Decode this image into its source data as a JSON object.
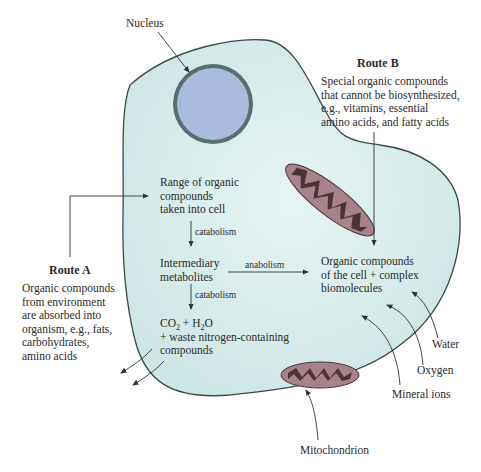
{
  "diagram": {
    "colors": {
      "cell_fill": "#dcefee",
      "cell_stroke": "#3b4a4a",
      "nucleus_fill": "#aabbdd",
      "nucleus_ring": "#55706e",
      "mito_outer": "#a8828a",
      "mito_inner": "#4a3438",
      "arrow": "#333333",
      "text": "#2b2b2b"
    },
    "labels": {
      "nucleus": "Nucleus",
      "mitochondrion": "Mitochondrion",
      "water": "Water",
      "oxygen": "Oxygen",
      "mineral_ions": "Mineral ions"
    },
    "route_a": {
      "title": "Route A",
      "lines": [
        "Organic compounds",
        "from environment",
        "are absorbed into",
        "organism, e.g., fats,",
        "carbohydrates,",
        "amino acids"
      ]
    },
    "route_b": {
      "title": "Route B",
      "lines": [
        "Special organic compounds",
        "that cannot be biosynthesized,",
        "e.g., vitamins, essential",
        "amino acids, and fatty acids"
      ]
    },
    "nodes": {
      "intake": [
        "Range of organic",
        "compounds",
        "taken into cell"
      ],
      "intermediary": [
        "Intermediary",
        "metabolites"
      ],
      "products": {
        "co2": "CO",
        "co2_sub": "2",
        "plus_h2o": " + H",
        "h2o_sub": "2",
        "o": "O",
        "line2": "+ waste nitrogen-containing",
        "line3": "compounds"
      },
      "organic_cell": [
        "Organic compounds",
        "of the cell + complex",
        "biomolecules"
      ]
    },
    "edges": {
      "catabolism_1": "catabolism",
      "catabolism_2": "catabolism",
      "anabolism": "anabolism"
    }
  }
}
